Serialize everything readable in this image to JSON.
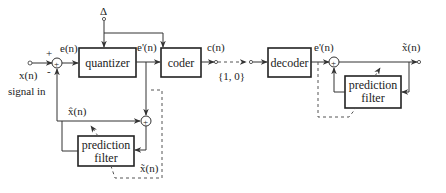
{
  "diagram": {
    "type": "block-diagram",
    "encoder": {
      "input_label": "x(n)",
      "input_caption": "signal in",
      "step_label": "Δ",
      "error_label": "e(n)",
      "quantized_error_label": "e'(n)",
      "code_label": "c(n)",
      "prediction_label": "x̂(n)",
      "reconstructed_label": "x̃(n)",
      "plus_sign": "+",
      "minus_sign": "-",
      "sum_symbol": "+",
      "blocks": {
        "quantizer": "quantizer",
        "coder": "coder",
        "prediction_filter_line1": "prediction",
        "prediction_filter_line2": "filter"
      }
    },
    "channel": {
      "bits_label": "{1, 0}"
    },
    "decoder": {
      "input_error_label": "e'(n)",
      "output_label": "x̃(n)",
      "sum_symbol": "+",
      "blocks": {
        "decoder": "decoder",
        "prediction_filter_line1": "prediction",
        "prediction_filter_line2": "filter"
      }
    }
  }
}
